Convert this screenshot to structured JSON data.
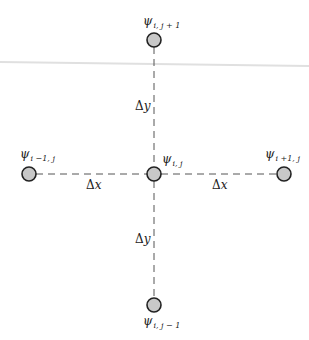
{
  "diagram": {
    "colors": {
      "node_fill": "#c8c8c8",
      "node_stroke": "#222222",
      "dash_line": "#555555",
      "background_rule": "#dcdcdc",
      "text": "#222222"
    },
    "nodes": [
      {
        "id": "center",
        "symbol": "ψ",
        "subscript": "i, j"
      },
      {
        "id": "top",
        "symbol": "ψ",
        "subscript": "i, j + 1"
      },
      {
        "id": "bottom",
        "symbol": "ψ",
        "subscript": "i, j − 1"
      },
      {
        "id": "left",
        "symbol": "ψ",
        "subscript": "i −1, j"
      },
      {
        "id": "right",
        "symbol": "ψ",
        "subscript": "i +1, j"
      }
    ],
    "spacing_labels": {
      "top": {
        "delta": "Δ",
        "var": "y"
      },
      "bottom": {
        "delta": "Δ",
        "var": "y"
      },
      "left": {
        "delta": "Δ",
        "var": "x"
      },
      "right": {
        "delta": "Δ",
        "var": "x"
      }
    }
  }
}
